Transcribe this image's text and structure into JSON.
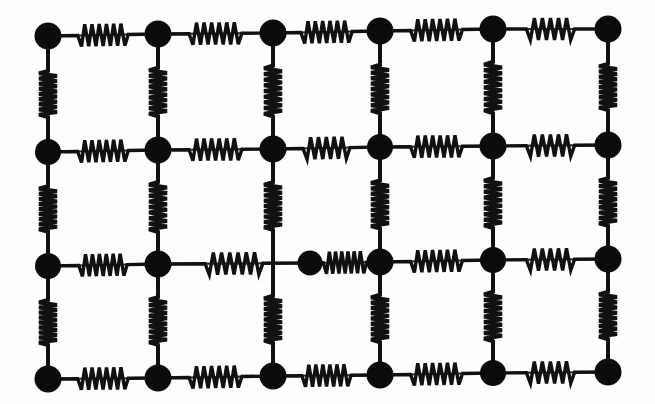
{
  "figure": {
    "background_color": "#fdfdfc",
    "mass_color": "#0b0b0a",
    "spring_color": "#111110",
    "bond_color": "#2a2a28",
    "canvas": {
      "width": 655,
      "height": 404
    }
  },
  "lattice": {
    "rows": 4,
    "columns": 6,
    "mass_radius": 12.5,
    "row_y": [
      36,
      152,
      264,
      378
    ],
    "column_x": [
      48,
      158,
      273,
      380,
      493,
      608
    ],
    "vacant_sites": [
      {
        "row": 2,
        "column": 2,
        "note": "lattice site crossed by bonds but not occupied by a mass"
      }
    ],
    "displaced_masses": [
      {
        "row": 2,
        "column": 2,
        "x": 310,
        "y": 264,
        "offset_x": 37,
        "note": "mass shifted right of its lattice site"
      }
    ],
    "masses": [
      {
        "id": "m-0-0",
        "row": 0,
        "col": 0,
        "x": 48,
        "y": 36,
        "radius": 13.5
      },
      {
        "id": "m-0-1",
        "row": 0,
        "col": 1,
        "x": 158,
        "y": 34,
        "radius": 13.5
      },
      {
        "id": "m-0-2",
        "row": 0,
        "col": 2,
        "x": 273,
        "y": 33,
        "radius": 13.5
      },
      {
        "id": "m-0-3",
        "row": 0,
        "col": 3,
        "x": 380,
        "y": 31,
        "radius": 13.5
      },
      {
        "id": "m-0-4",
        "row": 0,
        "col": 4,
        "x": 493,
        "y": 29,
        "radius": 13.5
      },
      {
        "id": "m-0-5",
        "row": 0,
        "col": 5,
        "x": 608,
        "y": 29,
        "radius": 13.5
      },
      {
        "id": "m-1-0",
        "row": 1,
        "col": 0,
        "x": 48,
        "y": 152,
        "radius": 13.0
      },
      {
        "id": "m-1-1",
        "row": 1,
        "col": 1,
        "x": 158,
        "y": 150,
        "radius": 13.5
      },
      {
        "id": "m-1-2",
        "row": 1,
        "col": 2,
        "x": 273,
        "y": 149,
        "radius": 13.5
      },
      {
        "id": "m-1-3",
        "row": 1,
        "col": 3,
        "x": 380,
        "y": 147,
        "radius": 13.0
      },
      {
        "id": "m-1-4",
        "row": 1,
        "col": 4,
        "x": 493,
        "y": 146,
        "radius": 13.5
      },
      {
        "id": "m-1-5",
        "row": 1,
        "col": 5,
        "x": 608,
        "y": 145,
        "radius": 13.5
      },
      {
        "id": "m-2-0",
        "row": 2,
        "col": 0,
        "x": 48,
        "y": 266,
        "radius": 13.0
      },
      {
        "id": "m-2-1",
        "row": 2,
        "col": 1,
        "x": 158,
        "y": 264,
        "radius": 13.5
      },
      {
        "id": "m-2-2",
        "row": 2,
        "col": 2,
        "x": 310,
        "y": 263,
        "radius": 12.5
      },
      {
        "id": "m-2-3",
        "row": 2,
        "col": 3,
        "x": 380,
        "y": 262,
        "radius": 13.5
      },
      {
        "id": "m-2-4",
        "row": 2,
        "col": 4,
        "x": 493,
        "y": 260,
        "radius": 13.0
      },
      {
        "id": "m-2-5",
        "row": 2,
        "col": 5,
        "x": 608,
        "y": 259,
        "radius": 13.5
      },
      {
        "id": "m-3-0",
        "row": 3,
        "col": 0,
        "x": 48,
        "y": 379,
        "radius": 13.5
      },
      {
        "id": "m-3-1",
        "row": 3,
        "col": 1,
        "x": 158,
        "y": 378,
        "radius": 13.5
      },
      {
        "id": "m-3-2",
        "row": 3,
        "col": 2,
        "x": 273,
        "y": 376,
        "radius": 13.5
      },
      {
        "id": "m-3-3",
        "row": 3,
        "col": 3,
        "x": 380,
        "y": 375,
        "radius": 13.5
      },
      {
        "id": "m-3-4",
        "row": 3,
        "col": 4,
        "x": 493,
        "y": 373,
        "radius": 13.0
      },
      {
        "id": "m-3-5",
        "row": 3,
        "col": 5,
        "x": 608,
        "y": 372,
        "radius": 13.5
      }
    ],
    "horizontal_springs": [
      {
        "id": "hs-0-0",
        "row": 0,
        "x1": 48,
        "y1": 36,
        "x2": 158,
        "y2": 34,
        "coils": 7,
        "amplitude": 11,
        "span_fraction": 0.46
      },
      {
        "id": "hs-0-1",
        "row": 0,
        "x1": 158,
        "y1": 34,
        "x2": 273,
        "y2": 33,
        "coils": 7,
        "amplitude": 11,
        "span_fraction": 0.46
      },
      {
        "id": "hs-0-2",
        "row": 0,
        "x1": 273,
        "y1": 33,
        "x2": 380,
        "y2": 31,
        "coils": 7,
        "amplitude": 11,
        "span_fraction": 0.48
      },
      {
        "id": "hs-0-3",
        "row": 0,
        "x1": 380,
        "y1": 31,
        "x2": 493,
        "y2": 29,
        "coils": 7,
        "amplitude": 11,
        "span_fraction": 0.46
      },
      {
        "id": "hs-0-4",
        "row": 0,
        "x1": 493,
        "y1": 29,
        "x2": 608,
        "y2": 29,
        "coils": 6,
        "amplitude": 11,
        "span_fraction": 0.42
      },
      {
        "id": "hs-1-0",
        "row": 1,
        "x1": 48,
        "y1": 152,
        "x2": 158,
        "y2": 150,
        "coils": 7,
        "amplitude": 11,
        "span_fraction": 0.46
      },
      {
        "id": "hs-1-1",
        "row": 1,
        "x1": 158,
        "y1": 150,
        "x2": 273,
        "y2": 149,
        "coils": 7,
        "amplitude": 11,
        "span_fraction": 0.46
      },
      {
        "id": "hs-1-2",
        "row": 1,
        "x1": 273,
        "y1": 149,
        "x2": 380,
        "y2": 147,
        "coils": 6,
        "amplitude": 11,
        "span_fraction": 0.44
      },
      {
        "id": "hs-1-3",
        "row": 1,
        "x1": 380,
        "y1": 147,
        "x2": 493,
        "y2": 146,
        "coils": 7,
        "amplitude": 11,
        "span_fraction": 0.46
      },
      {
        "id": "hs-1-4",
        "row": 1,
        "x1": 493,
        "y1": 146,
        "x2": 608,
        "y2": 145,
        "coils": 6,
        "amplitude": 11,
        "span_fraction": 0.42
      },
      {
        "id": "hs-2-0",
        "row": 2,
        "x1": 48,
        "y1": 266,
        "x2": 158,
        "y2": 264,
        "coils": 7,
        "amplitude": 11,
        "span_fraction": 0.44
      },
      {
        "id": "hs-2-1",
        "row": 2,
        "x1": 158,
        "y1": 264,
        "x2": 310,
        "y2": 263,
        "coils": 7,
        "amplitude": 11,
        "span_fraction": 0.38,
        "state": "stretched"
      },
      {
        "id": "hs-2-2",
        "row": 2,
        "x1": 310,
        "y1": 263,
        "x2": 380,
        "y2": 262,
        "coils": 7,
        "amplitude": 11,
        "span_fraction": 0.62,
        "state": "compressed"
      },
      {
        "id": "hs-2-3",
        "row": 2,
        "x1": 380,
        "y1": 262,
        "x2": 493,
        "y2": 260,
        "coils": 7,
        "amplitude": 11,
        "span_fraction": 0.46
      },
      {
        "id": "hs-2-4",
        "row": 2,
        "x1": 493,
        "y1": 260,
        "x2": 608,
        "y2": 259,
        "coils": 6,
        "amplitude": 11,
        "span_fraction": 0.42
      },
      {
        "id": "hs-3-0",
        "row": 3,
        "x1": 48,
        "y1": 379,
        "x2": 158,
        "y2": 378,
        "coils": 7,
        "amplitude": 11,
        "span_fraction": 0.46
      },
      {
        "id": "hs-3-1",
        "row": 3,
        "x1": 158,
        "y1": 378,
        "x2": 273,
        "y2": 376,
        "coils": 7,
        "amplitude": 11,
        "span_fraction": 0.46
      },
      {
        "id": "hs-3-2",
        "row": 3,
        "x1": 273,
        "y1": 376,
        "x2": 380,
        "y2": 375,
        "coils": 7,
        "amplitude": 11,
        "span_fraction": 0.46
      },
      {
        "id": "hs-3-3",
        "row": 3,
        "x1": 380,
        "y1": 375,
        "x2": 493,
        "y2": 373,
        "coils": 7,
        "amplitude": 11,
        "span_fraction": 0.46
      },
      {
        "id": "hs-3-4",
        "row": 3,
        "x1": 493,
        "y1": 373,
        "x2": 608,
        "y2": 372,
        "coils": 6,
        "amplitude": 11,
        "span_fraction": 0.42
      }
    ],
    "vertical_springs": [
      {
        "id": "vs-0-0",
        "col": 0,
        "x1": 48,
        "y1": 36,
        "x2": 48,
        "y2": 152,
        "coils": 9,
        "amplitude": 9,
        "span_fraction": 0.4
      },
      {
        "id": "vs-0-1",
        "col": 1,
        "x1": 158,
        "y1": 34,
        "x2": 158,
        "y2": 150,
        "coils": 9,
        "amplitude": 9,
        "span_fraction": 0.42
      },
      {
        "id": "vs-0-2",
        "col": 2,
        "x1": 273,
        "y1": 33,
        "x2": 273,
        "y2": 149,
        "coils": 9,
        "amplitude": 9,
        "span_fraction": 0.44
      },
      {
        "id": "vs-0-3",
        "col": 3,
        "x1": 380,
        "y1": 31,
        "x2": 380,
        "y2": 147,
        "coils": 9,
        "amplitude": 9,
        "span_fraction": 0.42
      },
      {
        "id": "vs-0-4",
        "col": 4,
        "x1": 493,
        "y1": 29,
        "x2": 493,
        "y2": 146,
        "coils": 9,
        "amplitude": 9,
        "span_fraction": 0.44
      },
      {
        "id": "vs-0-5",
        "col": 5,
        "x1": 608,
        "y1": 29,
        "x2": 608,
        "y2": 145,
        "coils": 9,
        "amplitude": 9,
        "span_fraction": 0.4
      },
      {
        "id": "vs-1-0",
        "col": 0,
        "x1": 48,
        "y1": 152,
        "x2": 48,
        "y2": 266,
        "coils": 9,
        "amplitude": 9,
        "span_fraction": 0.4
      },
      {
        "id": "vs-1-1",
        "col": 1,
        "x1": 158,
        "y1": 150,
        "x2": 158,
        "y2": 264,
        "coils": 9,
        "amplitude": 9,
        "span_fraction": 0.44
      },
      {
        "id": "vs-1-2",
        "col": 2,
        "x1": 273,
        "y1": 149,
        "x2": 273,
        "y2": 263,
        "coils": 9,
        "amplitude": 9,
        "span_fraction": 0.42
      },
      {
        "id": "vs-1-3",
        "col": 3,
        "x1": 380,
        "y1": 147,
        "x2": 380,
        "y2": 262,
        "coils": 9,
        "amplitude": 9,
        "span_fraction": 0.42
      },
      {
        "id": "vs-1-4",
        "col": 4,
        "x1": 493,
        "y1": 146,
        "x2": 493,
        "y2": 260,
        "coils": 9,
        "amplitude": 9,
        "span_fraction": 0.44
      },
      {
        "id": "vs-1-5",
        "col": 5,
        "x1": 608,
        "y1": 145,
        "x2": 608,
        "y2": 259,
        "coils": 9,
        "amplitude": 9,
        "span_fraction": 0.42
      },
      {
        "id": "vs-2-0",
        "col": 0,
        "x1": 48,
        "y1": 266,
        "x2": 48,
        "y2": 379,
        "coils": 9,
        "amplitude": 9,
        "span_fraction": 0.4
      },
      {
        "id": "vs-2-1",
        "col": 1,
        "x1": 158,
        "y1": 264,
        "x2": 158,
        "y2": 378,
        "coils": 9,
        "amplitude": 9,
        "span_fraction": 0.42
      },
      {
        "id": "vs-2-2",
        "col": 2,
        "x1": 273,
        "y1": 263,
        "x2": 273,
        "y2": 376,
        "coils": 9,
        "amplitude": 9,
        "span_fraction": 0.42
      },
      {
        "id": "vs-2-3",
        "col": 3,
        "x1": 380,
        "y1": 262,
        "x2": 380,
        "y2": 375,
        "coils": 9,
        "amplitude": 9,
        "span_fraction": 0.42
      },
      {
        "id": "vs-2-4",
        "col": 4,
        "x1": 493,
        "y1": 260,
        "x2": 493,
        "y2": 373,
        "coils": 9,
        "amplitude": 9,
        "span_fraction": 0.44
      },
      {
        "id": "vs-2-5",
        "col": 5,
        "x1": 608,
        "y1": 259,
        "x2": 608,
        "y2": 372,
        "coils": 9,
        "amplitude": 9,
        "span_fraction": 0.42
      }
    ]
  }
}
